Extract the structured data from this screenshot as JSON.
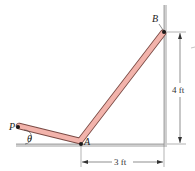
{
  "figure": {
    "points": {
      "P": {
        "label": "P",
        "x": 18,
        "y": 126
      },
      "A": {
        "label": "A",
        "x": 81,
        "y": 144
      },
      "B": {
        "label": "B",
        "x": 164,
        "y": 32
      }
    },
    "angle_label": "θ",
    "dimensions": {
      "horizontal": "3 ft",
      "vertical": "4 ft"
    },
    "colors": {
      "rod_fill": "#f2b3ab",
      "rod_stroke": "#7a4a44",
      "wall": "#c9c9c9",
      "wall_edge": "#9a9a9a",
      "pin": "#1a1a1a",
      "dimension_line": "#444444"
    }
  }
}
